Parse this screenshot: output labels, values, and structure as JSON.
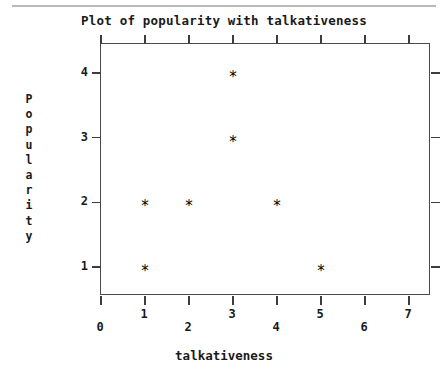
{
  "chart_data": {
    "type": "scatter",
    "title": "Plot of popularity with talkativeness",
    "xlabel": "talkativeness",
    "ylabel": "Popularity",
    "xlim": [
      0,
      7.5
    ],
    "ylim": [
      0.55,
      4.45
    ],
    "grid": false,
    "legend": null,
    "marker": "*",
    "marker_color": "#000000",
    "xticks": [
      0,
      1,
      2,
      3,
      4,
      5,
      6,
      7
    ],
    "xtick_labels": [
      "0",
      "1",
      "2",
      "3",
      "4",
      "5",
      "6",
      "7"
    ],
    "yticks": [
      1,
      2,
      3,
      4
    ],
    "ytick_labels": [
      "1",
      "2",
      "3",
      "4"
    ],
    "points": [
      {
        "x": 1,
        "y": 1
      },
      {
        "x": 5,
        "y": 1
      },
      {
        "x": 1,
        "y": 2
      },
      {
        "x": 2,
        "y": 2
      },
      {
        "x": 4,
        "y": 2
      },
      {
        "x": 3,
        "y": 3
      },
      {
        "x": 3,
        "y": 4
      }
    ],
    "series": [
      {
        "name": "popularity",
        "x": [
          1,
          5,
          1,
          2,
          4,
          3,
          3
        ],
        "values": [
          1,
          1,
          2,
          2,
          2,
          3,
          4
        ]
      }
    ]
  },
  "ylabel_letters": [
    "P",
    "o",
    "p",
    "u",
    "l",
    "a",
    "r",
    "i",
    "t",
    "y"
  ],
  "colors": {
    "axis": "#4a4a4a",
    "tick": "#3d3d3d",
    "text": "#1a1a1a",
    "marker": "#000000",
    "scan_line": "#b9b9b9",
    "background": "#ffffff"
  }
}
